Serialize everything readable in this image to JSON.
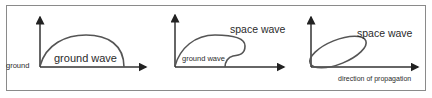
{
  "diagram": {
    "type": "radio wave propagation modes",
    "colors": {
      "stroke": "#333333",
      "wave": "#555555",
      "text": "#2b2b2b",
      "border": "#8a8a8a"
    },
    "panels": [
      {
        "id": "ground-wave-panel",
        "labels": {
          "axis_label": "ground",
          "wave_label": "ground wave"
        }
      },
      {
        "id": "ground-and-space-wave-panel",
        "labels": {
          "space_wave_label": "space wave",
          "ground_wave_label": "ground wave"
        }
      },
      {
        "id": "space-wave-panel",
        "labels": {
          "space_wave_label": "space wave",
          "axis_label": "direction of propagation"
        }
      }
    ]
  }
}
